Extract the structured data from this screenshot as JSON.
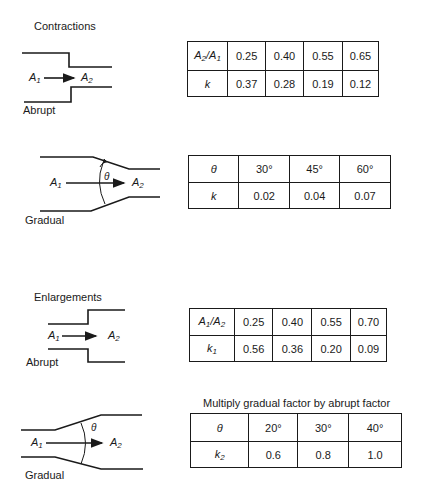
{
  "sections": {
    "contractions": {
      "title": "Contractions",
      "abrupt": {
        "label": "Abrupt",
        "from": "A",
        "from_sub": "1",
        "to": "A",
        "to_sub": "2",
        "table": {
          "header_label": "A2/A1",
          "header_values": [
            "0.25",
            "0.40",
            "0.55",
            "0.65"
          ],
          "row_label": "k",
          "row_values": [
            "0.37",
            "0.28",
            "0.19",
            "0.12"
          ]
        }
      },
      "gradual": {
        "label": "Gradual",
        "angle_symbol": "θ",
        "from": "A",
        "from_sub": "1",
        "to": "A",
        "to_sub": "2",
        "table": {
          "header_label": "θ",
          "header_values": [
            "30°",
            "45°",
            "60°"
          ],
          "row_label": "k",
          "row_values": [
            "0.02",
            "0.04",
            "0.07"
          ]
        }
      }
    },
    "enlargements": {
      "title": "Enlargements",
      "abrupt": {
        "label": "Abrupt",
        "from": "A",
        "from_sub": "1",
        "to": "A",
        "to_sub": "2",
        "table": {
          "header_label": "A1/A2",
          "header_values": [
            "0.25",
            "0.40",
            "0.55",
            "0.70"
          ],
          "row_label": "k1",
          "row_values": [
            "0.56",
            "0.36",
            "0.20",
            "0.09"
          ]
        }
      },
      "gradual": {
        "label": "Gradual",
        "angle_symbol": "θ",
        "note": "Multiply gradual factor by abrupt factor",
        "from": "A",
        "from_sub": "1",
        "to": "A",
        "to_sub": "2",
        "table": {
          "header_label": "θ",
          "header_values": [
            "20°",
            "30°",
            "40°"
          ],
          "row_label": "k2",
          "row_values": [
            "0.6",
            "0.8",
            "1.0"
          ]
        }
      }
    }
  },
  "colors": {
    "ink": "#1a1a1a",
    "background": "#ffffff"
  }
}
